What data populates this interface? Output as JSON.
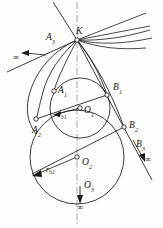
{
  "figure": {
    "type": "geometric-construction-diagram",
    "background_color": "#fdfdfc",
    "stroke_color": "#1a1a1a"
  },
  "labels": {
    "K": {
      "text": "K",
      "sub": "",
      "x": 76,
      "y": 27
    },
    "A3": {
      "text": "A",
      "sub": "3",
      "x": 46,
      "y": 33
    },
    "A1": {
      "text": "A",
      "sub": "1",
      "x": 58,
      "y": 86
    },
    "A2": {
      "text": "A",
      "sub": "2",
      "x": 32,
      "y": 126
    },
    "B1": {
      "text": "B",
      "sub": "1",
      "x": 113,
      "y": 83
    },
    "B2": {
      "text": "B",
      "sub": "2",
      "x": 129,
      "y": 121
    },
    "B3": {
      "text": "B",
      "sub": "3",
      "x": 136,
      "y": 140
    },
    "O1": {
      "text": "O",
      "sub": "1",
      "x": 84,
      "y": 106
    },
    "O2": {
      "text": "O",
      "sub": "2",
      "x": 82,
      "y": 158
    },
    "O3": {
      "text": "O",
      "sub": "3",
      "x": 84,
      "y": 181
    }
  },
  "radius_labels": {
    "rb1": {
      "text": "r",
      "sub": "b1",
      "x": 58,
      "y": 111
    },
    "rb2": {
      "text": "r",
      "sub": "b2",
      "x": 46,
      "y": 166
    }
  },
  "infinity_markers": {
    "left": {
      "symbol": "∞",
      "x": 13,
      "y": 53
    },
    "right": {
      "symbol": "∞",
      "x": 145,
      "y": 155
    },
    "bottom": {
      "symbol": "∞",
      "x": 78,
      "y": 202
    }
  },
  "geometry": {
    "axis": {
      "x": 77,
      "y_top": 2,
      "y_bottom": 224,
      "style": "dash-dot"
    },
    "point_K": {
      "x": 77,
      "y": 40
    },
    "circle_1": {
      "cx": 80,
      "cy": 108,
      "r": 30,
      "label": "O1"
    },
    "circle_2": {
      "cx": 77,
      "cy": 157,
      "r": 47,
      "label": "O2"
    },
    "points": [
      {
        "name": "K",
        "x": 77,
        "y": 40
      },
      {
        "name": "A1",
        "x": 54,
        "y": 91
      },
      {
        "name": "A2",
        "x": 36,
        "y": 119
      },
      {
        "name": "A3",
        "x": 59,
        "y": 41
      },
      {
        "name": "B1",
        "x": 107,
        "y": 95
      },
      {
        "name": "B2",
        "x": 124,
        "y": 127
      },
      {
        "name": "O1",
        "x": 80,
        "y": 108
      },
      {
        "name": "O2",
        "x": 77,
        "y": 157
      }
    ]
  }
}
